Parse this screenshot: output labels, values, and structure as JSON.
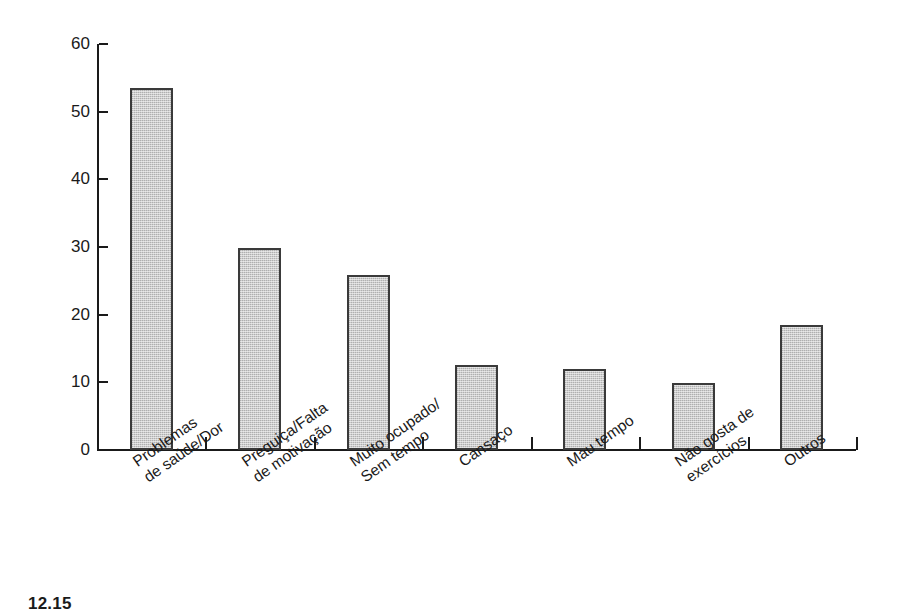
{
  "chart_data": {
    "type": "bar",
    "title": "",
    "xlabel": "",
    "ylabel": "Porcentagem",
    "ylim": [
      0,
      60
    ],
    "ytick_values": [
      0,
      10,
      20,
      30,
      40,
      50,
      60
    ],
    "ytick_labels": [
      "0",
      "10",
      "20",
      "30",
      "40",
      "50",
      "60"
    ],
    "grid": false,
    "legend": null,
    "categories": [
      "Problemas de saúde/Dor",
      "Preguiça/Falta de motivação",
      "Muito ocupado/ Sem tempo",
      "Cansaço",
      "Mau tempo",
      "Não gosta de exercícios",
      "Outros"
    ],
    "category_lines": [
      [
        "Problemas",
        "de saúde/Dor"
      ],
      [
        "Preguiça/Falta",
        "de motivação"
      ],
      [
        "Muito ocupado/",
        "Sem tempo"
      ],
      [
        "Cansaço",
        ""
      ],
      [
        "Mau tempo",
        ""
      ],
      [
        "Não gosta de",
        "exercícios"
      ],
      [
        "Outros",
        ""
      ]
    ],
    "values": [
      53.5,
      29.9,
      25.8,
      12.5,
      12.0,
      9.9,
      18.5
    ],
    "bar_color": "#cccccc",
    "bar_edge_color": "#3a3a3a",
    "axis_color": "#1a1a1a",
    "background": "#ffffff"
  },
  "caption": {
    "text": "12.15"
  }
}
